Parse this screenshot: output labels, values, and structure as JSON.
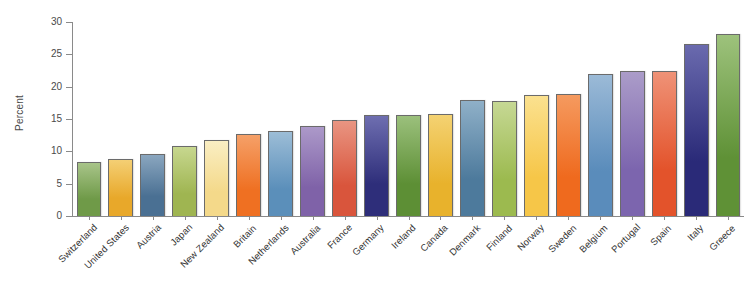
{
  "chart_data": {
    "type": "bar",
    "title": "",
    "xlabel": "",
    "ylabel": "Percent",
    "ylim": [
      0,
      30
    ],
    "yticks": [
      0,
      5,
      10,
      15,
      20,
      25,
      30
    ],
    "grid": false,
    "legend": "none",
    "categories": [
      "Switzerland",
      "United States",
      "Austria",
      "Japan",
      "New Zealand",
      "Britain",
      "Netherlands",
      "Australia",
      "France",
      "Germany",
      "Ireland",
      "Canada",
      "Denmark",
      "Finland",
      "Norway",
      "Sweden",
      "Belgium",
      "Portugal",
      "Spain",
      "Italy",
      "Greece"
    ],
    "values": [
      8.3,
      8.8,
      9.6,
      10.8,
      11.7,
      12.7,
      13.1,
      13.9,
      14.8,
      15.6,
      15.6,
      15.8,
      17.9,
      17.8,
      18.7,
      18.8,
      22.0,
      22.4,
      22.4,
      26.6,
      28.2
    ],
    "bar_colors": [
      "#6f9a48",
      "#e8a82a",
      "#4a7093",
      "#9fb551",
      "#f4d98a",
      "#ef7022",
      "#5b8fba",
      "#7f62a8",
      "#d9553c",
      "#2e2e7a",
      "#5d8f35",
      "#e8b22c",
      "#4d7a9c",
      "#9cba4f",
      "#f6c648",
      "#ef6a1e",
      "#5a8cbb",
      "#7c65ae",
      "#e3532b",
      "#2a2a78",
      "#5f9136"
    ],
    "bar_colors_top": [
      "#a8c489",
      "#f4cf74",
      "#8aa6bf",
      "#c7d78f",
      "#faeec3",
      "#f5a068",
      "#9cbdd7",
      "#ac99c9",
      "#e99582",
      "#6e6eb0",
      "#9bc07c",
      "#f4d272",
      "#8fb0c8",
      "#c6d894",
      "#fbe18f",
      "#f59a5f",
      "#9bbad7",
      "#ab9cc9",
      "#ef9277",
      "#6a6aae",
      "#9dc27c"
    ]
  }
}
